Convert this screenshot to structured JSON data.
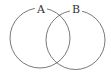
{
  "diagram": {
    "type": "venn",
    "sets": [
      {
        "label": "A",
        "cx": 40,
        "cy": 38,
        "r": 30
      },
      {
        "label": "B",
        "cx": 75.5,
        "cy": 40,
        "r": 29.5
      }
    ],
    "stroke_color": "#555555",
    "background": "#ffffff"
  }
}
